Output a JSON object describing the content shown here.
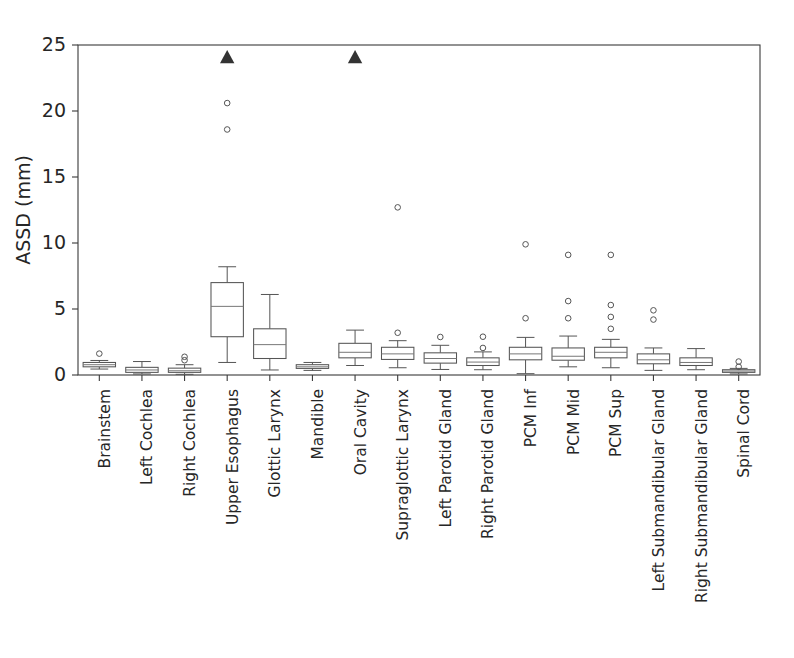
{
  "chart_data": {
    "type": "boxplot",
    "title": "",
    "xlabel": "",
    "ylabel": "ASSD (mm)",
    "ylim": [
      0,
      25
    ],
    "yticks": [
      0,
      5,
      10,
      15,
      20,
      25
    ],
    "grid": false,
    "legend": "none",
    "categories": [
      "Brainstem",
      "Left Cochlea",
      "Right Cochlea",
      "Upper Esophagus",
      "Glottic Larynx",
      "Mandible",
      "Oral Cavity",
      "Supraglottic Larynx",
      "Left Parotid Gland",
      "Right Parotid Gland",
      "PCM Inf",
      "PCM Mid",
      "PCM Sup",
      "Left Submandibular Gland",
      "Right Submandibular Gland",
      "Spinal Cord"
    ],
    "note_categories_count": 15,
    "boxes": [
      {
        "label": "Brainstem",
        "whisker_low": 0.45,
        "q1": 0.62,
        "median": 0.78,
        "q3": 0.95,
        "whisker_high": 1.1,
        "outliers": [
          1.62
        ]
      },
      {
        "label": "Left Cochlea",
        "whisker_low": 0.08,
        "q1": 0.2,
        "median": 0.38,
        "q3": 0.58,
        "whisker_high": 1.02,
        "outliers": []
      },
      {
        "label": "Right Cochlea",
        "whisker_low": 0.05,
        "q1": 0.2,
        "median": 0.32,
        "q3": 0.52,
        "whisker_high": 0.78,
        "outliers": [
          1.12,
          1.38
        ]
      },
      {
        "label": "Upper Esophagus",
        "whisker_low": 0.95,
        "q1": 2.9,
        "median": 5.2,
        "q3": 7.0,
        "whisker_high": 8.2,
        "outliers": [
          18.6,
          20.6
        ],
        "significance_marker": 24.0
      },
      {
        "label": "Glottic Larynx",
        "whisker_low": 0.38,
        "q1": 1.25,
        "median": 2.3,
        "q3": 3.5,
        "whisker_high": 6.1,
        "outliers": []
      },
      {
        "label": "Mandible",
        "whisker_low": 0.35,
        "q1": 0.5,
        "median": 0.62,
        "q3": 0.78,
        "whisker_high": 0.95,
        "outliers": []
      },
      {
        "label": "Oral Cavity",
        "whisker_low": 0.72,
        "q1": 1.3,
        "median": 1.72,
        "q3": 2.4,
        "whisker_high": 3.4,
        "outliers": [],
        "significance_marker": 24.0
      },
      {
        "label": "Supraglottic Larynx",
        "whisker_low": 0.55,
        "q1": 1.18,
        "median": 1.6,
        "q3": 2.1,
        "whisker_high": 2.6,
        "outliers": [
          3.2,
          12.7
        ]
      },
      {
        "label": "Left Parotid Gland",
        "whisker_low": 0.42,
        "q1": 0.9,
        "median": 1.25,
        "q3": 1.68,
        "whisker_high": 2.25,
        "outliers": [
          2.88
        ]
      },
      {
        "label": "Right Parotid Gland",
        "whisker_low": 0.4,
        "q1": 0.72,
        "median": 0.98,
        "q3": 1.3,
        "whisker_high": 1.75,
        "outliers": [
          2.05,
          2.9
        ]
      },
      {
        "label": "PCM Inf",
        "whisker_low": 0.1,
        "q1": 1.15,
        "median": 1.6,
        "q3": 2.1,
        "whisker_high": 2.85,
        "outliers": [
          4.3,
          9.9
        ]
      },
      {
        "label": "PCM Mid",
        "whisker_low": 0.62,
        "q1": 1.12,
        "median": 1.42,
        "q3": 2.05,
        "whisker_high": 2.95,
        "outliers": [
          4.3,
          5.6,
          9.1
        ]
      },
      {
        "label": "PCM Sup",
        "whisker_low": 0.55,
        "q1": 1.3,
        "median": 1.72,
        "q3": 2.1,
        "whisker_high": 2.7,
        "outliers": [
          3.5,
          4.4,
          5.3,
          9.1
        ]
      },
      {
        "label": "Left Submandibular Gland",
        "whisker_low": 0.35,
        "q1": 0.85,
        "median": 1.15,
        "q3": 1.6,
        "whisker_high": 2.05,
        "outliers": [
          4.2,
          4.9
        ]
      },
      {
        "label": "Right Submandibular Gland",
        "whisker_low": 0.4,
        "q1": 0.72,
        "median": 0.95,
        "q3": 1.3,
        "whisker_high": 2.0,
        "outliers": []
      },
      {
        "label": "Spinal Cord",
        "whisker_low": 0.08,
        "q1": 0.2,
        "median": 0.3,
        "q3": 0.4,
        "whisker_high": 0.5,
        "outliers": [
          0.62,
          1.02
        ]
      }
    ],
    "significance_markers": [
      {
        "category": "Upper Esophagus",
        "value": 24.0,
        "glyph": "filled-triangle-up"
      },
      {
        "category": "Oral Cavity",
        "value": 24.0,
        "glyph": "filled-triangle-up"
      }
    ],
    "colors": {
      "box_stroke": "#555555",
      "box_fill": "#ffffff",
      "median": "#777777",
      "marker": "#333333",
      "axis": "#3a3a3a",
      "text": "#262626",
      "background": "#ffffff"
    }
  }
}
